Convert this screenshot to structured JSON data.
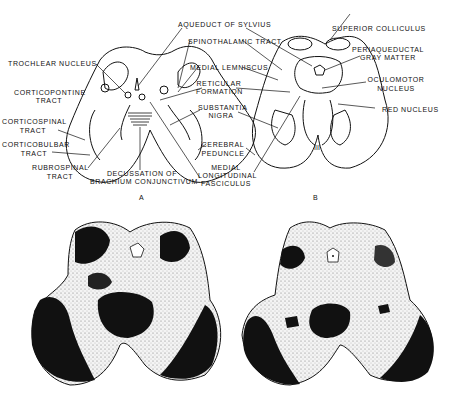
{
  "figure": {
    "panel_a": {
      "caption": "A",
      "labels": {
        "trochlear_nucleus": "TROCHLEAR  NUCLEUS",
        "corticopontine_1": "CORTICOPONTINE",
        "corticopontine_2": "TRACT",
        "corticospinal_1": "CORTICOSPINAL",
        "corticospinal_2": "TRACT",
        "corticobulbar_1": "CORTICOBULBAR",
        "corticobulbar_2": "TRACT",
        "rubrospinal_1": "RUBROSPINAL",
        "rubrospinal_2": "TRACT",
        "decussation_1": "DECUSSATION OF",
        "decussation_2": "BRACHIUM CONJUNCTIVUM"
      }
    },
    "center_labels": {
      "aqueduct": "AQUEDUCT OF SYLVIUS",
      "spinothalamic": "SPINOTHALAMIC TRACT",
      "medial_lemniscus": "MEDIAL LEMNISCUS",
      "reticular_1": "RETICULAR",
      "reticular_2": "FORMATION",
      "substantia_1": "SUBSTANTIA",
      "substantia_2": "NIGRA",
      "cerebral_1": "CEREBRAL",
      "cerebral_2": "PEDUNCLE",
      "mlf_1": "MEDIAL",
      "mlf_2": "LONGITUDINAL",
      "mlf_3": "FASCICULUS"
    },
    "panel_b": {
      "caption": "B",
      "nerve_label": "III",
      "labels": {
        "superior_colliculus": "SUPERIOR  COLLICULUS",
        "periaqueductal_1": "PERIAQUEDUCTAL",
        "periaqueductal_2": "GRAY MATTER",
        "oculomotor_1": "OCULOMOTOR",
        "oculomotor_2": "NUCLEUS",
        "red_nucleus": "RED NUCLEUS"
      }
    },
    "photos": {
      "left": "midbrain-section-trochlear-level",
      "right": "midbrain-section-oculomotor-level"
    }
  }
}
